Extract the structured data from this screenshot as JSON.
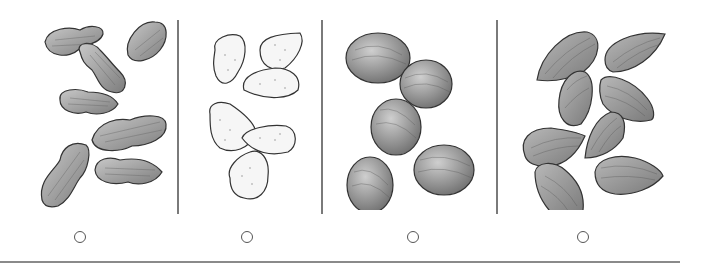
{
  "question": {
    "options": [
      {
        "id": "A",
        "item": "peanuts-in-shell",
        "selected": false
      },
      {
        "id": "B",
        "item": "blanched-almonds",
        "selected": false
      },
      {
        "id": "C",
        "item": "hazelnuts",
        "selected": false
      },
      {
        "id": "D",
        "item": "almonds",
        "selected": false
      }
    ]
  },
  "colors": {
    "nut_dark": "#8c8c8c",
    "nut_light": "#f2f2f2",
    "outline": "#3a3a3a",
    "divider": "#7a7a7a"
  }
}
